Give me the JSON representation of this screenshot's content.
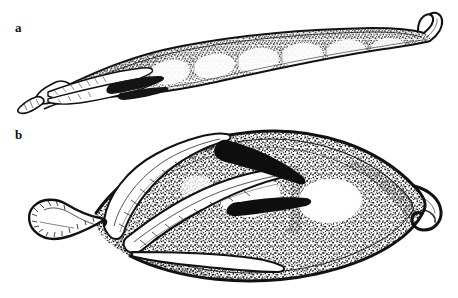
{
  "plate": {
    "type": "scientific-botanical-illustration",
    "medium": "pen-and-ink stipple engraving",
    "background_color": "#ffffff",
    "ink_color": "#111111",
    "width": 458,
    "height": 298,
    "caption_style": "lowercase bold serif letters at upper-left of each panel"
  },
  "panels": [
    {
      "id": "a",
      "label": "a",
      "label_x": 15,
      "label_y": 21,
      "subject": "elongate slender legume pod (mature fruit), lateral view",
      "orientation": "horizontal, stalk at left, beak at right",
      "bounds": {
        "x": 20,
        "y": 18,
        "width": 430,
        "height": 85
      },
      "features": [
        "long narrow linear pod, gently arched dorsal margin",
        "six to seven swollen seed chambers visible through the valve wall",
        "fine stipple shading dense along dorsal suture, fading to white over each seed",
        "persistent calyx with narrow acuminate lobes at the base",
        "short thick pedicel (stalk) truncate at the extreme left",
        "upturned hooked beak (persistent style) at the right apex"
      ],
      "seed_count": 7,
      "shading": "graded stipple, darkest along sutures and between seeds"
    },
    {
      "id": "b",
      "label": "b",
      "label_x": 15,
      "label_y": 128,
      "subject": "short inflated broad legume pod (immature or distinct species), lateral view",
      "orientation": "horizontal, stalk at left, beak at right",
      "bounds": {
        "x": 20,
        "y": 120,
        "width": 430,
        "height": 165
      },
      "features": [
        "broadly ovate strongly inflated pod, widest near the middle",
        "heavy coarse stipple over the whole valve surface",
        "two large pale elliptic highlights marking the seeds beneath the wall",
        "prominent thickened dorsal and ventral sutures drawn as heavy lines",
        "long narrow persistent calyx lobes sweeping back over the pod",
        "stout clavate pedicel with rounded swollen base at far left",
        "strongly recurved hooked beak at the right apex"
      ],
      "seed_count": 2,
      "shading": "dense coarse stipple, reserved white around each seed boss"
    }
  ],
  "labels": {
    "a": "a",
    "b": "b"
  }
}
